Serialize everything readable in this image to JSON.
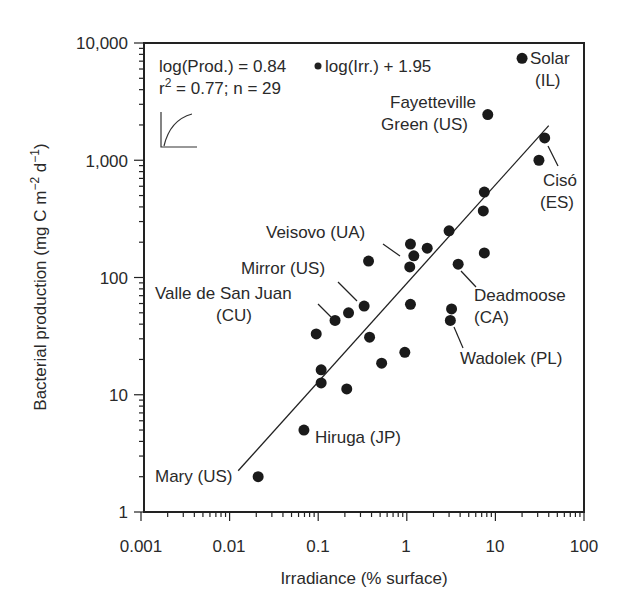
{
  "chart_data": {
    "type": "scatter",
    "title": "",
    "xlabel": "Irradiance (% surface)",
    "ylabel": "Bacterial production (mg C m-2 d-1)",
    "xscale": "log",
    "yscale": "log",
    "xlim": [
      0.001,
      100
    ],
    "ylim": [
      1,
      10000
    ],
    "x_ticks": [
      "0.001",
      "0.01",
      "0.1",
      "1",
      "10",
      "100"
    ],
    "y_ticks": [
      "1",
      "10",
      "100",
      "1,000",
      "10,000"
    ],
    "grid": false,
    "legend": null,
    "equation": "log(Prod.) = 0.84 • log(Irr.) + 1.95",
    "stats": "r² = 0.77; n = 29",
    "regression": {
      "slope": 0.84,
      "intercept": 1.95,
      "x_range": [
        0.0125,
        40
      ]
    },
    "points": [
      {
        "x": 20,
        "y": 7400,
        "label": "Solar (IL)"
      },
      {
        "x": 8.2,
        "y": 2450,
        "label": "Fayetteville Green (US)"
      },
      {
        "x": 36,
        "y": 1550,
        "label": "Cisó (ES)"
      },
      {
        "x": 31,
        "y": 1000
      },
      {
        "x": 7.5,
        "y": 535
      },
      {
        "x": 7.3,
        "y": 370
      },
      {
        "x": 3.0,
        "y": 250
      },
      {
        "x": 1.1,
        "y": 193
      },
      {
        "x": 1.7,
        "y": 178
      },
      {
        "x": 1.2,
        "y": 153
      },
      {
        "x": 1.08,
        "y": 123,
        "label": "Veisovo (UA)"
      },
      {
        "x": 7.5,
        "y": 162
      },
      {
        "x": 3.8,
        "y": 130,
        "label": "Deadmoose (CA)"
      },
      {
        "x": 1.1,
        "y": 59
      },
      {
        "x": 3.2,
        "y": 54
      },
      {
        "x": 3.1,
        "y": 43,
        "label": "Wadolek (PL)"
      },
      {
        "x": 0.95,
        "y": 23
      },
      {
        "x": 0.52,
        "y": 18.6
      },
      {
        "x": 0.37,
        "y": 138
      },
      {
        "x": 0.33,
        "y": 57,
        "label": "Mirror (US)"
      },
      {
        "x": 0.22,
        "y": 50
      },
      {
        "x": 0.155,
        "y": 43,
        "label": "Valle de San Juan (CU)"
      },
      {
        "x": 0.095,
        "y": 33
      },
      {
        "x": 0.38,
        "y": 31
      },
      {
        "x": 0.108,
        "y": 16.3
      },
      {
        "x": 0.108,
        "y": 12.6
      },
      {
        "x": 0.21,
        "y": 11.2
      },
      {
        "x": 0.069,
        "y": 5.0,
        "label": "Hiruga (JP)"
      },
      {
        "x": 0.021,
        "y": 2.0,
        "label": "Mary (US)"
      }
    ],
    "annotations": [
      {
        "text": "Solar",
        "line2": "(IL)"
      },
      {
        "text": "Fayetteville",
        "line2": "Green (US)"
      },
      {
        "text": "Cisó",
        "line2": "(ES)"
      },
      {
        "text": "Veisovo (UA)"
      },
      {
        "text": "Mirror (US)"
      },
      {
        "text": "Valle de San Juan",
        "line2": "(CU)"
      },
      {
        "text": "Deadmoose",
        "line2": "(CA)"
      },
      {
        "text": "Wadolek (PL)"
      },
      {
        "text": "Hiruga (JP)"
      },
      {
        "text": "Mary (US)"
      }
    ]
  },
  "labels": {
    "eq_part1": "log(Prod.) = 0.84",
    "eq_part2": "log(Irr.) + 1.95",
    "r2_prefix": "r",
    "r2_sup": "2",
    "r2_rest": " = 0.77; n = 29",
    "ylabel_main": "Bacterial production (mg C m",
    "ylabel_sup1": "−2",
    "ylabel_mid": " d",
    "ylabel_sup2": "−1",
    "ylabel_end": ")",
    "xlabel": "Irradiance (% surface)",
    "solar_1": "Solar",
    "solar_2": "(IL)",
    "fay_1": "Fayetteville",
    "fay_2": "Green (US)",
    "ciso_1": "Cisó",
    "ciso_2": "(ES)",
    "veisovo": "Veisovo (UA)",
    "mirror": "Mirror (US)",
    "valle_1": "Valle de San Juan",
    "valle_2": "(CU)",
    "dead_1": "Deadmoose",
    "dead_2": "(CA)",
    "wadolek": "Wadolek (PL)",
    "hiruga": "Hiruga (JP)",
    "mary": "Mary (US)",
    "xt0": "0.001",
    "xt1": "0.01",
    "xt2": "0.1",
    "xt3": "1",
    "xt4": "10",
    "xt5": "100",
    "yt0": "1",
    "yt1": "10",
    "yt2": "100",
    "yt3": "1,000",
    "yt4": "10,000"
  }
}
